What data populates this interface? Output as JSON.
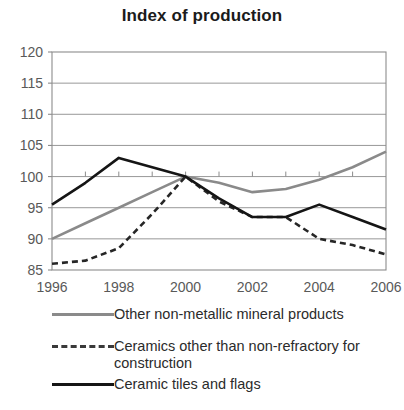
{
  "chart_data": {
    "type": "line",
    "title": "Index of production",
    "xlabel": "",
    "ylabel": "",
    "x": [
      1996,
      1997,
      1998,
      1999,
      2000,
      2001,
      2002,
      2003,
      2004,
      2005,
      2006
    ],
    "xlim": [
      1996,
      2006
    ],
    "ylim": [
      85,
      120
    ],
    "yticks": [
      85,
      90,
      95,
      100,
      105,
      110,
      115,
      120
    ],
    "xticks": [
      1996,
      1998,
      2000,
      2002,
      2004,
      2006
    ],
    "xtick_labels": [
      "1996",
      "1998",
      "2000",
      "2002",
      "2004",
      "2006"
    ],
    "ytick_labels": [
      "85",
      "90",
      "95",
      "100",
      "105",
      "110",
      "115",
      "120"
    ],
    "grid": true,
    "grid_axis": "y",
    "legend_position": "bottom",
    "series": [
      {
        "name": "Other non-metallic mineral products",
        "style": "solid",
        "color": "#8a8a8a",
        "width": 2.6,
        "values": [
          90.0,
          92.5,
          95.0,
          97.5,
          100.0,
          99.0,
          97.5,
          98.0,
          99.5,
          101.5,
          104.0
        ]
      },
      {
        "name": "Ceramics other than non-refractory for construction",
        "style": "dashed",
        "color": "#262626",
        "width": 2.6,
        "values": [
          86.0,
          86.5,
          88.5,
          94.0,
          100.0,
          96.0,
          93.5,
          93.5,
          90.0,
          89.0,
          87.5
        ]
      },
      {
        "name": "Ceramic tiles and flags",
        "style": "solid",
        "color": "#151515",
        "width": 2.6,
        "values": [
          95.5,
          99.0,
          103.0,
          101.5,
          100.0,
          96.5,
          93.5,
          93.5,
          95.5,
          93.5,
          91.5
        ]
      }
    ]
  },
  "legend": {
    "items": [
      {
        "label": "Other non-metallic mineral products",
        "style": "solid",
        "color": "#8a8a8a"
      },
      {
        "label": "Ceramics other than non-refractory for\nconstruction",
        "style": "dashed",
        "color": "#3a3a3a"
      },
      {
        "label": "Ceramic tiles and flags",
        "style": "solid",
        "color": "#151515"
      }
    ]
  }
}
